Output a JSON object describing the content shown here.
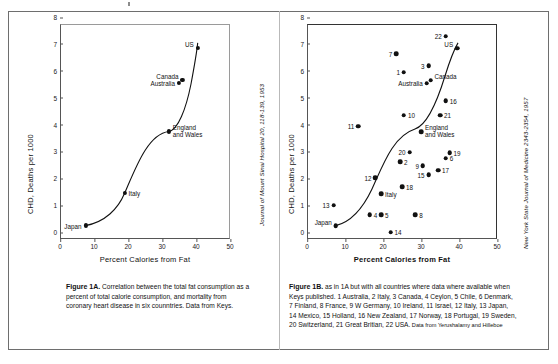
{
  "figure": {
    "panel_a": {
      "citation": "Journal of Mount Sinai Hospital 20, 118-139, 1953",
      "caption_bold": "Figure 1A.",
      "caption_text": " Correlation between the total fat consumption as a percent of total calorie consumption, and mortality from coronary heart disease in six counntries. Data from Keys."
    },
    "panel_b": {
      "citation": "New York State Journal of Medicine 2343-2354, 1957",
      "caption_bold": "Figure 1B.",
      "caption_text": " as in 1A but with all countries where data where available when Keys published. 1 Australia, 2 Italy, 3 Canada, 4 Ceylon, 5 Chile, 6 Denmark, 7 Finland, 8 France, 9 W Germany, 10 Ireland, 11 Israel, 12 Italy, 13 Japan, 14 Mexico, 15 Holland, 16 New Zealand, 17 Norway, 18 Portugal, 19 Sweden, 20 Switzerland, 21 Great Britian, 22 USA.",
      "caption_source": " Data from Yerushalamy and Hilleboe"
    }
  },
  "chart_data": [
    {
      "id": "figure-1a",
      "type": "scatter",
      "title": "Figure 1A",
      "xlabel": "Percent Calories from Fat",
      "ylabel": "CHD, Deaths per 1000",
      "xlim": [
        0,
        50
      ],
      "ylim": [
        0,
        8
      ],
      "xticks": [
        0,
        10,
        20,
        30,
        40,
        50
      ],
      "yticks": [
        0,
        1,
        2,
        3,
        4,
        5,
        6,
        7,
        8
      ],
      "grid": false,
      "legend": "none",
      "trendline": true,
      "points": [
        {
          "label": "Japan",
          "x": 7.5,
          "y": 0.5,
          "label_pos": "left"
        },
        {
          "label": "Italy",
          "x": 19.0,
          "y": 1.7,
          "label_pos": "right"
        },
        {
          "label": "England and Wales",
          "x": 32.0,
          "y": 4.0,
          "label_pos": "right"
        },
        {
          "label": "Australia",
          "x": 35.0,
          "y": 5.8,
          "label_pos": "left"
        },
        {
          "label": "Canada",
          "x": 36.0,
          "y": 5.9,
          "label_pos": "upleft"
        },
        {
          "label": "US",
          "x": 40.5,
          "y": 7.1,
          "label_pos": "upleft"
        }
      ]
    },
    {
      "id": "figure-1b",
      "type": "scatter",
      "title": "Figure 1B",
      "xlabel": "Percent Calories from Fat",
      "ylabel": "CHD, Deaths per 1000",
      "xlim": [
        0,
        50
      ],
      "ylim": [
        0,
        8
      ],
      "xticks": [
        0,
        10,
        20,
        30,
        40,
        50
      ],
      "yticks": [
        0,
        1,
        2,
        3,
        4,
        5,
        6,
        7,
        8
      ],
      "grid": false,
      "legend": "none",
      "trendline": true,
      "points": [
        {
          "label": "13",
          "x": 7.0,
          "y": 1.25,
          "label_pos": "left"
        },
        {
          "label": "Japan",
          "x": 7.6,
          "y": 0.5,
          "label_pos": "upleft"
        },
        {
          "label": "11",
          "x": 13.5,
          "y": 4.2,
          "label_pos": "left"
        },
        {
          "label": "4",
          "x": 16.5,
          "y": 0.9,
          "label_pos": "right"
        },
        {
          "label": "5",
          "x": 19.5,
          "y": 0.9,
          "label_pos": "right"
        },
        {
          "label": "12",
          "x": 18.0,
          "y": 2.27,
          "label_pos": "left"
        },
        {
          "label": "Italy",
          "x": 19.5,
          "y": 1.68,
          "label_pos": "right"
        },
        {
          "label": "14",
          "x": 22.0,
          "y": 0.25,
          "label_pos": "right"
        },
        {
          "label": "7",
          "x": 23.5,
          "y": 6.9,
          "label_pos": "left"
        },
        {
          "label": "1",
          "x": 25.5,
          "y": 6.2,
          "label_pos": "left"
        },
        {
          "label": "10",
          "x": 25.5,
          "y": 4.6,
          "label_pos": "right"
        },
        {
          "label": "2",
          "x": 24.5,
          "y": 2.88,
          "label_pos": "right"
        },
        {
          "label": "18",
          "x": 25.0,
          "y": 1.95,
          "label_pos": "right"
        },
        {
          "label": "20",
          "x": 27.0,
          "y": 3.22,
          "label_pos": "left"
        },
        {
          "label": "8",
          "x": 28.5,
          "y": 0.9,
          "label_pos": "right"
        },
        {
          "label": "Australia",
          "x": 31.5,
          "y": 5.8,
          "label_pos": "left"
        },
        {
          "label": "Canada",
          "x": 32.5,
          "y": 5.9,
          "label_pos": "upright"
        },
        {
          "label": "3",
          "x": 32.0,
          "y": 6.45,
          "label_pos": "left"
        },
        {
          "label": "9",
          "x": 30.5,
          "y": 2.72,
          "label_pos": "left"
        },
        {
          "label": "15",
          "x": 32.0,
          "y": 2.38,
          "label_pos": "left"
        },
        {
          "label": "England and Wales",
          "x": 30.0,
          "y": 4.0,
          "label_pos": "right"
        },
        {
          "label": "22",
          "x": 36.5,
          "y": 7.55,
          "label_pos": "left"
        },
        {
          "label": "US",
          "x": 39.5,
          "y": 7.1,
          "label_pos": "upleft"
        },
        {
          "label": "21",
          "x": 35.0,
          "y": 4.6,
          "label_pos": "right"
        },
        {
          "label": "16",
          "x": 36.5,
          "y": 5.15,
          "label_pos": "right"
        },
        {
          "label": "17",
          "x": 34.5,
          "y": 2.55,
          "label_pos": "right"
        },
        {
          "label": "6",
          "x": 36.5,
          "y": 3.0,
          "label_pos": "right"
        },
        {
          "label": "19",
          "x": 37.5,
          "y": 3.2,
          "label_pos": "right"
        }
      ]
    }
  ]
}
